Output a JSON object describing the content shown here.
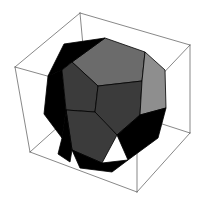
{
  "scene": {
    "title": "Dodecahedron inscribed in a cube",
    "background_color": "#ffffff",
    "canvas": {
      "width": 200,
      "height": 209
    }
  },
  "bounding_cube": {
    "name": "wireframe-cube",
    "edge_color": "#555555",
    "edge_width": 0.7,
    "fill": "none",
    "vertices": {
      "front_top_left": [
        15,
        67
      ],
      "front_top_right": [
        137,
        101
      ],
      "back_top_left": [
        80,
        13
      ],
      "back_top_right": [
        190,
        45
      ],
      "front_bottom_left": [
        30,
        152
      ],
      "front_bottom_right": [
        137,
        192
      ],
      "back_bottom_left": [
        88,
        100
      ],
      "back_bottom_right": [
        190,
        133
      ]
    },
    "edges": [
      [
        "front_top_left",
        "back_top_left"
      ],
      [
        "back_top_left",
        "back_top_right"
      ],
      [
        "back_top_right",
        "front_top_right"
      ],
      [
        "front_top_right",
        "front_top_left"
      ],
      [
        "front_bottom_left",
        "back_bottom_left"
      ],
      [
        "back_bottom_left",
        "back_bottom_right"
      ],
      [
        "back_bottom_right",
        "front_bottom_right"
      ],
      [
        "front_bottom_right",
        "front_bottom_left"
      ],
      [
        "front_top_left",
        "front_bottom_left"
      ],
      [
        "back_top_left",
        "back_bottom_left"
      ],
      [
        "back_top_right",
        "back_bottom_right"
      ],
      [
        "front_top_right",
        "front_bottom_right"
      ]
    ]
  },
  "dodecahedron": {
    "name": "shaded-dodecahedron",
    "outline_color": "#000000",
    "outline_width": 0.8,
    "shading": "flat-faceted, light from upper right",
    "face_colors": {
      "black": "#000000",
      "dark_gray": "#3b3b3b",
      "mid_gray": "#6b6b6b",
      "light_gray": "#8e8e8e",
      "pale_gray": "#a6a6a6"
    },
    "faces": [
      {
        "id": "top-pentagon",
        "shade": "mid_gray",
        "points": "105,38 145,52 142,81 98,86 72,62"
      },
      {
        "id": "upper-left-pentagon",
        "shade": "black",
        "points": "105,38 72,62 62,70 48,76 64,44"
      },
      {
        "id": "left-pentagon",
        "shade": "black",
        "points": "48,76 62,70 66,110 62,138 44,114"
      },
      {
        "id": "front-upper-pentagon",
        "shade": "dark_gray",
        "points": "72,62 98,86 95,112 66,110 62,70"
      },
      {
        "id": "front-right-pentagon",
        "shade": "dark_gray",
        "points": "98,86 142,81 140,115 117,135 95,112"
      },
      {
        "id": "front-lower-pentagon",
        "shade": "dark_gray",
        "points": "66,110 95,112 117,135 102,163 72,150"
      },
      {
        "id": "right-pentagon",
        "shade": "light_gray",
        "points": "142,81 145,52 165,70 166,108 140,115"
      },
      {
        "id": "lower-right-pentagon",
        "shade": "black",
        "points": "140,115 166,108 158,138 128,160 117,135"
      },
      {
        "id": "bottom-left-pentagon",
        "shade": "black",
        "points": "62,138 66,110 72,150 70,162 58,154"
      },
      {
        "id": "bottom-pentagon",
        "shade": "black",
        "points": "72,150 102,163 128,160 112,172 80,168"
      }
    ]
  }
}
